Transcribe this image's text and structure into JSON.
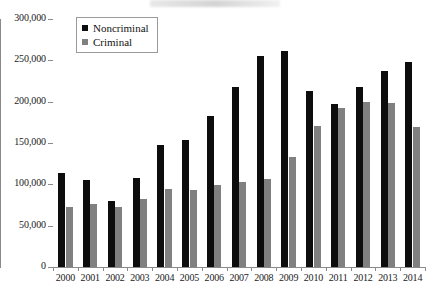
{
  "chart_data": {
    "type": "bar",
    "title": "",
    "xlabel": "",
    "ylabel": "",
    "ylim": [
      0,
      300000
    ],
    "ytick_labels": [
      "0",
      "50,000",
      "100,000",
      "150,000",
      "200,000",
      "250,000",
      "300,000"
    ],
    "ytick_values": [
      0,
      50000,
      100000,
      150000,
      200000,
      250000,
      300000
    ],
    "grid": false,
    "legend_position": "top-left",
    "categories": [
      "2000",
      "2001",
      "2002",
      "2003",
      "2004",
      "2005",
      "2006",
      "2007",
      "2008",
      "2009",
      "2010",
      "2011",
      "2012",
      "2013",
      "2014"
    ],
    "series": [
      {
        "name": "Noncriminal",
        "color": "#0d0d0d",
        "values": [
          114000,
          105000,
          80000,
          108000,
          148000,
          154000,
          183000,
          218000,
          255000,
          261000,
          213000,
          197000,
          218000,
          237000,
          248000
        ]
      },
      {
        "name": "Criminal",
        "color": "#808080",
        "values": [
          72000,
          76000,
          72000,
          82000,
          94000,
          93000,
          99000,
          103000,
          106000,
          133000,
          170000,
          192000,
          200000,
          199000,
          169000
        ]
      }
    ]
  }
}
